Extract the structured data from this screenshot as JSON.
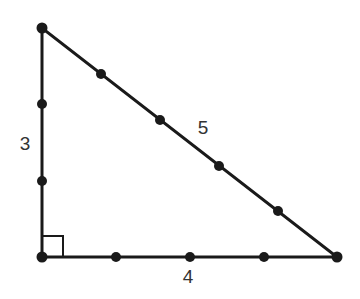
{
  "figure": {
    "background_color": "#ffffff",
    "stroke_color": "#1a1a1a",
    "label_color": "#333333",
    "stroke_width": 3,
    "dot_radius": 5,
    "vertices": {
      "apex": {
        "x": 42,
        "y": 28
      },
      "right_angle": {
        "x": 42,
        "y": 257
      },
      "base_right": {
        "x": 337,
        "y": 257
      }
    },
    "right_angle_marker": {
      "size": 21,
      "stroke_width": 2,
      "present": true
    },
    "edges": [
      {
        "name": "vertical-leg",
        "label": "3",
        "label_x": 25,
        "label_y": 145,
        "tick_count": 3,
        "dots": [
          {
            "x": 42,
            "y": 28
          },
          {
            "x": 42,
            "y": 104
          },
          {
            "x": 42,
            "y": 181
          },
          {
            "x": 42,
            "y": 257
          }
        ]
      },
      {
        "name": "horizontal-leg",
        "label": "4",
        "label_x": 188,
        "label_y": 278,
        "tick_count": 4,
        "dots": [
          {
            "x": 42,
            "y": 257
          },
          {
            "x": 116,
            "y": 257
          },
          {
            "x": 190,
            "y": 257
          },
          {
            "x": 264,
            "y": 257
          },
          {
            "x": 337,
            "y": 257
          }
        ]
      },
      {
        "name": "hypotenuse",
        "label": "5",
        "label_x": 203,
        "label_y": 129,
        "tick_count": 5,
        "dots": [
          {
            "x": 42,
            "y": 28
          },
          {
            "x": 101,
            "y": 74
          },
          {
            "x": 160,
            "y": 120
          },
          {
            "x": 219,
            "y": 166
          },
          {
            "x": 278,
            "y": 211
          },
          {
            "x": 337,
            "y": 257
          }
        ]
      }
    ]
  }
}
